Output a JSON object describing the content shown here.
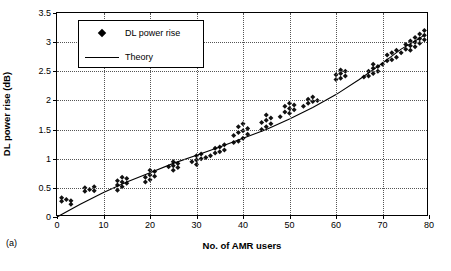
{
  "panel": {
    "label": "(a)"
  },
  "legend": {
    "entries": [
      {
        "label": "DL power rise",
        "marker": "diamond",
        "color": "#000000"
      },
      {
        "label": "Theory",
        "marker": "line",
        "color": "#000000"
      }
    ]
  },
  "chart_data": {
    "type": "scatter",
    "title": "",
    "xlabel": "No. of AMR users",
    "ylabel": "DL power rise (dB)",
    "xlim": [
      0,
      80
    ],
    "ylim": [
      0,
      3.5
    ],
    "xticks": [
      0,
      10,
      20,
      30,
      40,
      50,
      60,
      70,
      80
    ],
    "yticks": [
      0,
      0.5,
      1,
      1.5,
      2,
      2.5,
      3,
      3.5
    ],
    "xtick_labels": [
      "0",
      "10",
      "20",
      "30",
      "40",
      "50",
      "60",
      "70",
      "80"
    ],
    "ytick_labels": [
      "0",
      "0.5",
      "1",
      "1.5",
      "2",
      "2.5",
      "3",
      "3.5"
    ],
    "grid": {
      "horizontal": true,
      "vertical": true,
      "style": "dotted"
    },
    "legend_position": "top-left-inside",
    "series": [
      {
        "name": "DL power rise",
        "type": "scatter",
        "marker": "diamond",
        "color": "#000000",
        "points": [
          [
            1,
            0.27
          ],
          [
            1,
            0.33
          ],
          [
            2,
            0.3
          ],
          [
            3,
            0.22
          ],
          [
            3,
            0.28
          ],
          [
            6,
            0.44
          ],
          [
            6,
            0.5
          ],
          [
            7,
            0.47
          ],
          [
            8,
            0.45
          ],
          [
            8,
            0.52
          ],
          [
            13,
            0.46
          ],
          [
            13,
            0.55
          ],
          [
            13,
            0.62
          ],
          [
            14,
            0.52
          ],
          [
            14,
            0.6
          ],
          [
            14,
            0.68
          ],
          [
            15,
            0.58
          ],
          [
            15,
            0.66
          ],
          [
            19,
            0.6
          ],
          [
            19,
            0.68
          ],
          [
            20,
            0.64
          ],
          [
            20,
            0.72
          ],
          [
            20,
            0.8
          ],
          [
            21,
            0.7
          ],
          [
            21,
            0.78
          ],
          [
            24,
            0.86
          ],
          [
            25,
            0.8
          ],
          [
            25,
            0.88
          ],
          [
            25,
            0.95
          ],
          [
            26,
            0.85
          ],
          [
            26,
            0.92
          ],
          [
            29,
            0.95
          ],
          [
            30,
            0.9
          ],
          [
            30,
            0.98
          ],
          [
            30,
            1.05
          ],
          [
            31,
            1.0
          ],
          [
            31,
            1.08
          ],
          [
            32,
            1.02
          ],
          [
            33,
            1.05
          ],
          [
            34,
            1.1
          ],
          [
            34,
            1.18
          ],
          [
            35,
            1.12
          ],
          [
            35,
            1.2
          ],
          [
            36,
            1.15
          ],
          [
            36,
            1.24
          ],
          [
            38,
            1.28
          ],
          [
            38,
            1.4
          ],
          [
            39,
            1.3
          ],
          [
            39,
            1.45
          ],
          [
            39,
            1.55
          ],
          [
            40,
            1.35
          ],
          [
            40,
            1.48
          ],
          [
            40,
            1.6
          ],
          [
            41,
            1.42
          ],
          [
            41,
            1.52
          ],
          [
            44,
            1.5
          ],
          [
            44,
            1.62
          ],
          [
            45,
            1.55
          ],
          [
            45,
            1.66
          ],
          [
            45,
            1.75
          ],
          [
            46,
            1.6
          ],
          [
            46,
            1.7
          ],
          [
            48,
            1.72
          ],
          [
            49,
            1.8
          ],
          [
            49,
            1.9
          ],
          [
            50,
            1.78
          ],
          [
            50,
            1.86
          ],
          [
            50,
            1.95
          ],
          [
            51,
            1.84
          ],
          [
            51,
            1.92
          ],
          [
            53,
            1.9
          ],
          [
            54,
            1.95
          ],
          [
            54,
            2.02
          ],
          [
            55,
            1.98
          ],
          [
            55,
            2.06
          ],
          [
            56,
            2.0
          ],
          [
            60,
            2.36
          ],
          [
            60,
            2.44
          ],
          [
            61,
            2.38
          ],
          [
            61,
            2.46
          ],
          [
            61,
            2.52
          ],
          [
            62,
            2.42
          ],
          [
            62,
            2.5
          ],
          [
            66,
            2.4
          ],
          [
            67,
            2.42
          ],
          [
            67,
            2.5
          ],
          [
            68,
            2.46
          ],
          [
            68,
            2.55
          ],
          [
            68,
            2.62
          ],
          [
            69,
            2.5
          ],
          [
            69,
            2.58
          ],
          [
            70,
            2.62
          ],
          [
            71,
            2.68
          ],
          [
            71,
            2.78
          ],
          [
            72,
            2.7
          ],
          [
            72,
            2.82
          ],
          [
            73,
            2.74
          ],
          [
            73,
            2.86
          ],
          [
            74,
            2.82
          ],
          [
            75,
            2.88
          ],
          [
            75,
            2.96
          ],
          [
            76,
            2.86
          ],
          [
            76,
            2.94
          ],
          [
            76,
            3.02
          ],
          [
            77,
            2.92
          ],
          [
            77,
            3.0
          ],
          [
            77,
            3.08
          ],
          [
            78,
            2.98
          ],
          [
            78,
            3.06
          ],
          [
            78,
            3.14
          ],
          [
            79,
            3.04
          ],
          [
            79,
            3.12
          ],
          [
            79,
            3.2
          ]
        ]
      },
      {
        "name": "Theory",
        "type": "line",
        "color": "#000000",
        "points": [
          [
            0,
            0.0
          ],
          [
            5,
            0.22
          ],
          [
            10,
            0.42
          ],
          [
            15,
            0.6
          ],
          [
            20,
            0.76
          ],
          [
            25,
            0.92
          ],
          [
            30,
            1.06
          ],
          [
            35,
            1.2
          ],
          [
            40,
            1.35
          ],
          [
            45,
            1.5
          ],
          [
            50,
            1.68
          ],
          [
            55,
            1.88
          ],
          [
            60,
            2.1
          ],
          [
            65,
            2.36
          ],
          [
            70,
            2.64
          ],
          [
            74,
            2.88
          ],
          [
            77,
            3.02
          ],
          [
            79,
            3.12
          ]
        ]
      }
    ]
  }
}
